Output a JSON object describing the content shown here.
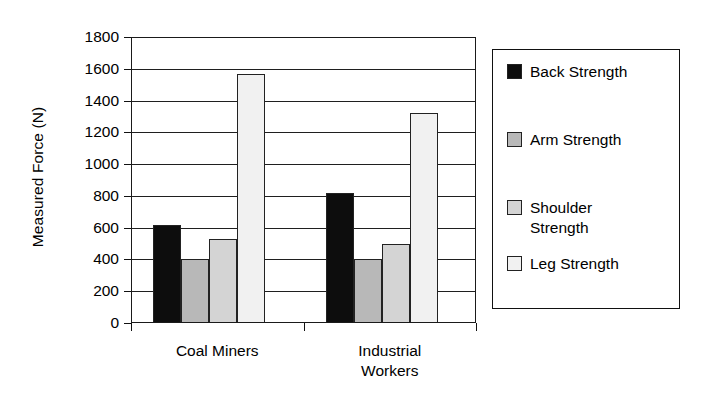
{
  "chart_data": {
    "type": "bar",
    "title": "",
    "xlabel": "",
    "ylabel": "Measured Force (N)",
    "categories": [
      "Coal Miners",
      "Industrial\nWorkers"
    ],
    "series": [
      {
        "name": "Back Strength",
        "values": [
          615,
          820
        ],
        "color": "#0d0d0d"
      },
      {
        "name": "Arm Strength",
        "values": [
          405,
          405
        ],
        "color": "#b8b8b8"
      },
      {
        "name": "Shoulder\nStrength",
        "values": [
          530,
          500
        ],
        "color": "#d4d4d4"
      },
      {
        "name": "Leg Strength",
        "values": [
          1570,
          1320
        ],
        "color": "#f1f1f1"
      }
    ],
    "ylim": [
      0,
      1800
    ],
    "ytick_step": 200,
    "yticks": [
      0,
      200,
      400,
      600,
      800,
      1000,
      1200,
      1400,
      1600,
      1800
    ],
    "ytick_labels": [
      "0",
      "200",
      "400",
      "600",
      "800",
      "1000",
      "1200",
      "1400",
      "1600",
      "1800"
    ],
    "grid": true,
    "grid_axis": "y",
    "legend_position": "right",
    "legend_entries": [
      "Back Strength",
      "Arm Strength",
      "Shoulder\nStrength",
      "Leg Strength"
    ]
  }
}
